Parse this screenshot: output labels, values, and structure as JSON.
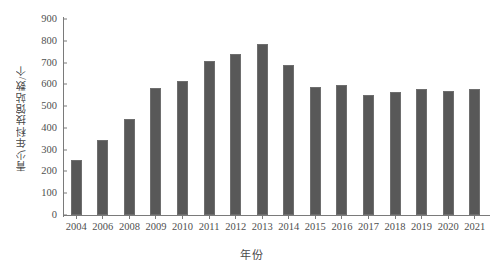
{
  "chart_data": {
    "type": "bar",
    "title": "",
    "xlabel": "年份",
    "ylabel": "青少年科技馆站数/个",
    "categories": [
      "2004",
      "2006",
      "2008",
      "2009",
      "2010",
      "2011",
      "2012",
      "2013",
      "2014",
      "2015",
      "2016",
      "2017",
      "2018",
      "2019",
      "2020",
      "2021"
    ],
    "values": [
      252,
      344,
      440,
      585,
      617,
      707,
      740,
      785,
      690,
      588,
      598,
      553,
      565,
      580,
      570,
      580
    ],
    "ylim": [
      0,
      900
    ],
    "yticks": [
      0,
      100,
      200,
      300,
      400,
      500,
      600,
      700,
      800,
      900
    ],
    "ytick_labels": [
      "0",
      "100",
      "200",
      "300",
      "400",
      "500",
      "600",
      "700",
      "800",
      "900"
    ],
    "grid": false,
    "legend": null,
    "series": [
      {
        "name": "青少年科技馆站数",
        "values": [
          252,
          344,
          440,
          585,
          617,
          707,
          740,
          785,
          690,
          588,
          598,
          553,
          565,
          580,
          570,
          580
        ]
      }
    ],
    "colors": {
      "bar_fill": "#585858",
      "bar_stroke": "#6e6e6e",
      "axis": "#7a7a7a",
      "text": "#4f4f4f",
      "background": "#ffffff"
    }
  }
}
